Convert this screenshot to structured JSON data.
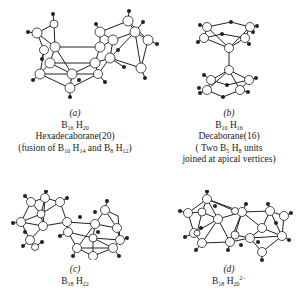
{
  "figure": {
    "panels": [
      {
        "id": "a",
        "label": "(a)",
        "formula": {
          "b": "B",
          "b_sub": "16",
          "h": "H",
          "h_sub": "20",
          "charge": ""
        },
        "name": "Hexadecaborane(20)",
        "note_parts": {
          "pre": "(fusion of B",
          "s1": "10",
          "mid1": " H",
          "s2": "14",
          "mid2": " and B",
          "s3": "8",
          "mid3": " H",
          "s4": "12",
          "post": ")"
        }
      },
      {
        "id": "b",
        "label": "(b)",
        "formula": {
          "b": "B",
          "b_sub": "10",
          "h": "H",
          "h_sub": "16",
          "charge": ""
        },
        "name": "Decaborane(16)",
        "note_parts": {
          "pre": "( Two B",
          "s1": "5",
          "mid1": " H",
          "s2": "8",
          "post": " units"
        },
        "note_line2": "joined at apical vertices)"
      },
      {
        "id": "c",
        "label": "(c)",
        "formula": {
          "b": "B",
          "b_sub": "18",
          "h": "H",
          "h_sub": "22",
          "charge": ""
        }
      },
      {
        "id": "d",
        "label": "(d)",
        "formula": {
          "b": "B",
          "b_sub": "18",
          "h": "H",
          "h_sub": "20",
          "charge": "2−"
        }
      }
    ]
  }
}
